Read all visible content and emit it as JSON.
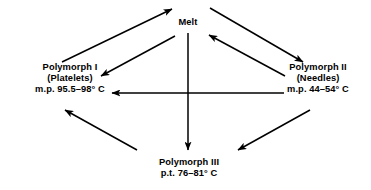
{
  "diagram": {
    "line_color": "#000000",
    "text_color": "#000000",
    "background": "#ffffff",
    "nodes": {
      "melt": {
        "label": "Melt"
      },
      "polymorph_1": {
        "name": "Polymorph I",
        "habit": "(Platelets)",
        "transition": "m.p. 95.5–98° C"
      },
      "polymorph_2": {
        "name": "Polymorph II",
        "habit": "(Needles)",
        "transition": "m.p. 44–54° C"
      },
      "polymorph_3": {
        "name": "Polymorph III",
        "transition": "p.t. 76–81° C"
      }
    },
    "edges": [
      {
        "id": "p1-to-melt",
        "from": "polymorph_1",
        "to": "melt",
        "direction": "up-right"
      },
      {
        "id": "melt-to-p1",
        "from": "melt",
        "to": "polymorph_1",
        "direction": "down-left"
      },
      {
        "id": "melt-to-p2",
        "from": "melt",
        "to": "polymorph_2",
        "direction": "down-right"
      },
      {
        "id": "p2-to-melt",
        "from": "polymorph_2",
        "to": "melt",
        "direction": "up-left"
      },
      {
        "id": "melt-to-p3",
        "from": "melt",
        "to": "polymorph_3",
        "direction": "down"
      },
      {
        "id": "p2-to-p1",
        "from": "polymorph_2",
        "to": "polymorph_1",
        "direction": "left"
      },
      {
        "id": "p3-to-p1",
        "from": "polymorph_3",
        "to": "polymorph_1",
        "direction": "up-left"
      },
      {
        "id": "p2-to-p3",
        "from": "polymorph_2",
        "to": "polymorph_3",
        "direction": "down-left"
      }
    ]
  }
}
